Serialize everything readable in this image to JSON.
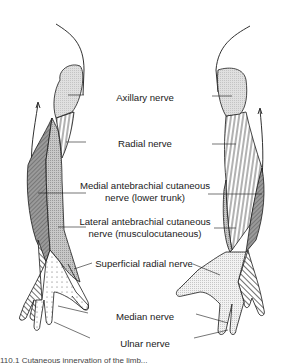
{
  "figure": {
    "type": "anatomical-diagram",
    "labels": [
      {
        "id": "axillary",
        "text": "Axillary nerve"
      },
      {
        "id": "radial",
        "text": "Radial nerve"
      },
      {
        "id": "medial_line1",
        "text": "Medial antebrachial cutaneous"
      },
      {
        "id": "medial_line2",
        "text": "nerve (lower trunk)"
      },
      {
        "id": "lateral_line1",
        "text": "Lateral antebrachial cutaneous"
      },
      {
        "id": "lateral_line2",
        "text": "nerve (musculocutaneous)"
      },
      {
        "id": "superficial_radial",
        "text": "Superficial radial nerve"
      },
      {
        "id": "median",
        "text": "Median nerve"
      },
      {
        "id": "ulnar",
        "text": "Ulnar nerve"
      }
    ],
    "caption_visible": "110.1  Cutaneous innervation of the limb..."
  },
  "colors": {
    "outline": "#1a1a1a",
    "axillary_fill": "#d9d9d9",
    "medial_fill": "#8c8c8c",
    "lateral_fill": "#b5b5b5",
    "median_fill": "#f2f2f2",
    "background": "#ffffff"
  }
}
